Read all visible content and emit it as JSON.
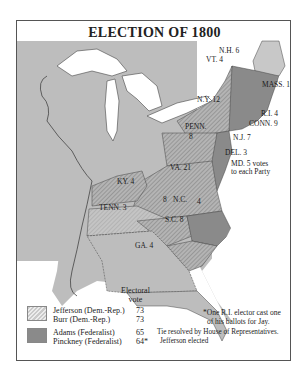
{
  "title": "ELECTION OF 1800",
  "colors": {
    "territory": "#bdbdbd",
    "federalist": "#8a8a8a",
    "dem_rep_hatch": "#a8a8a8",
    "maine": "#c8c8c8",
    "water": "#ffffff"
  },
  "states": [
    {
      "label": "N.H. 6",
      "party": "Federalist"
    },
    {
      "label": "VT. 4",
      "party": "Federalist"
    },
    {
      "label": "MASS. 16",
      "party": "Federalist"
    },
    {
      "label": "N.Y. 12",
      "party": "Dem.-Rep."
    },
    {
      "label": "R.I. 4",
      "party": "Federalist"
    },
    {
      "label": "CONN. 9",
      "party": "Federalist"
    },
    {
      "label": "PENN.",
      "votes_label": "8",
      "party": "Dem.-Rep."
    },
    {
      "label": "N.J. 7",
      "party": "Federalist"
    },
    {
      "label": "DEL. 3",
      "party": "Federalist"
    },
    {
      "label": "MD. 5 votes",
      "label2": "to each Party",
      "party": "Split"
    },
    {
      "label": "VA. 21",
      "party": "Dem.-Rep."
    },
    {
      "label": "KY. 4",
      "party": "Dem.-Rep."
    },
    {
      "label": "TENN. 3",
      "party": "Dem.-Rep."
    },
    {
      "label": "N.C.",
      "votes_dr": "8",
      "votes_fed": "4",
      "party": "Split"
    },
    {
      "label": "S.C. 8",
      "party": "Dem.-Rep."
    },
    {
      "label": "GA. 4",
      "party": "Dem.-Rep."
    }
  ],
  "legend": {
    "header_line1": "Electoral",
    "header_line2": "vote",
    "rows": [
      {
        "name": "Jefferson (Dem.-Rep.)",
        "vote": "73"
      },
      {
        "name": "Burr  (Dem.-Rep.)",
        "vote": "73"
      },
      {
        "name": "Adams (Federalist)",
        "vote": "65"
      },
      {
        "name": "Pinckney (Federalist)",
        "vote": "64*"
      }
    ]
  },
  "notes": {
    "footnote_line1": "*One R.I. elector cast one",
    "footnote_line2": "of his ballots for Jay.",
    "tie_line1": "Tie resolved by House of Representatives.",
    "tie_line2": "Jefferson elected"
  }
}
